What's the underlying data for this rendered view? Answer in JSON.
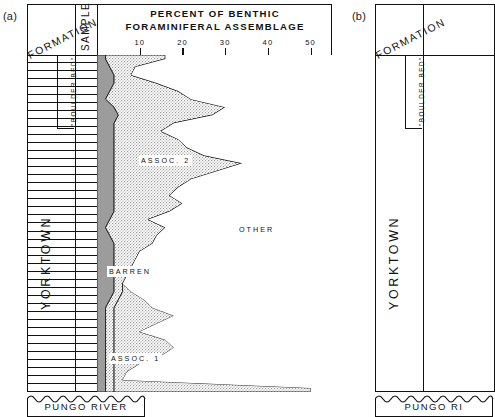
{
  "figure": {
    "panel_a_tag": "(a)",
    "panel_b_tag": "(b)"
  },
  "panel_a": {
    "chart_title_line1": "PERCENT OF BENTHIC",
    "chart_title_line2": "FORAMINIFERAL ASSEMBLAGE",
    "col_formation_header": "FORMATION",
    "col_sample_header": "SAMPLE",
    "formations": {
      "boulder_bed": "\"BOULDER BED\"",
      "yorktown": "YORKTOWN",
      "pungo_river": "PUNGO RIVER"
    },
    "area_labels": {
      "assoc2": "ASSOC. 2",
      "assoc1": "ASSOC. 1",
      "barren": "BARREN",
      "other": "OTHER"
    }
  },
  "panel_b": {
    "col_formation_header": "FORMATION",
    "formations": {
      "boulder_bed": "\"BOULDER BED\"",
      "yorktown": "YORKTOWN",
      "pungo_river": "PUNGO RI"
    }
  },
  "chart_data": {
    "type": "area",
    "title": "PERCENT OF BENTHIC FORAMINIFERAL ASSEMBLAGE",
    "xlabel": "PERCENT OF BENTHIC FORAMINIFERAL ASSEMBLAGE",
    "ylabel": "SAMPLE",
    "xlim": [
      0,
      55
    ],
    "ylim": [
      1,
      42
    ],
    "xticks": [
      10,
      20,
      30,
      40,
      50
    ],
    "xticklabels": [
      "10",
      "20",
      "30",
      "40",
      "50"
    ],
    "grid": false,
    "orientation": "horizontal-stacked-vertical-axis",
    "legend": [
      "BARREN",
      "ASSOC. 2",
      "ASSOC. 1",
      "OTHER"
    ],
    "categories": [
      1,
      2,
      3,
      4,
      5,
      6,
      7,
      8,
      9,
      10,
      11,
      12,
      13,
      14,
      15,
      16,
      17,
      18,
      19,
      20,
      21,
      22,
      23,
      24,
      25,
      26,
      27,
      28,
      29,
      30,
      31,
      32,
      33,
      34,
      35,
      36,
      37,
      38,
      39,
      40,
      41,
      42
    ],
    "series": [
      {
        "name": "BARREN",
        "fill": "#9c9c9c",
        "note": "solid gray band, cumulative left boundary",
        "values": [
          2,
          3,
          4,
          4,
          3,
          2,
          4,
          5,
          4,
          4,
          4,
          4,
          4,
          4,
          4,
          4,
          4,
          4,
          4,
          4,
          3,
          2,
          3,
          4,
          4,
          4,
          4,
          4,
          4,
          4,
          3,
          2,
          2,
          2,
          2,
          2,
          2,
          2,
          2,
          2,
          2,
          2
        ]
      },
      {
        "name": "ASSOC. 2",
        "fill": "#d9d9d9",
        "note": "stippled band; the upper association, cumulative value = BARREN + ASSOC2",
        "values": [
          14,
          6,
          4,
          10,
          16,
          20,
          26,
          22,
          14,
          11,
          15,
          17,
          21,
          30,
          24,
          18,
          15,
          13,
          16,
          13,
          9,
          14,
          11,
          9,
          6,
          5,
          4,
          3,
          2,
          2,
          2,
          2,
          2,
          2,
          2,
          2,
          2,
          2,
          2,
          2,
          2,
          2
        ]
      },
      {
        "name": "ASSOC. 1",
        "fill": "#d9d9d9",
        "note": "stippled band in lower part of section",
        "values": [
          0,
          0,
          0,
          0,
          0,
          0,
          0,
          0,
          0,
          0,
          0,
          0,
          0,
          0,
          0,
          0,
          0,
          0,
          0,
          0,
          0,
          0,
          0,
          0,
          0,
          0,
          0,
          0,
          0,
          2,
          6,
          9,
          14,
          10,
          6,
          12,
          14,
          11,
          6,
          3,
          2,
          46
        ]
      },
      {
        "name": "OTHER",
        "fill": "#ffffff",
        "note": "white remainder to right edge of plot",
        "values": [
          39,
          46,
          47,
          41,
          36,
          33,
          25,
          28,
          37,
          40,
          36,
          34,
          30,
          21,
          27,
          33,
          36,
          38,
          35,
          38,
          43,
          39,
          41,
          42,
          45,
          46,
          47,
          48,
          49,
          47,
          46,
          44,
          39,
          43,
          47,
          41,
          39,
          42,
          47,
          50,
          51,
          7
        ]
      }
    ]
  }
}
